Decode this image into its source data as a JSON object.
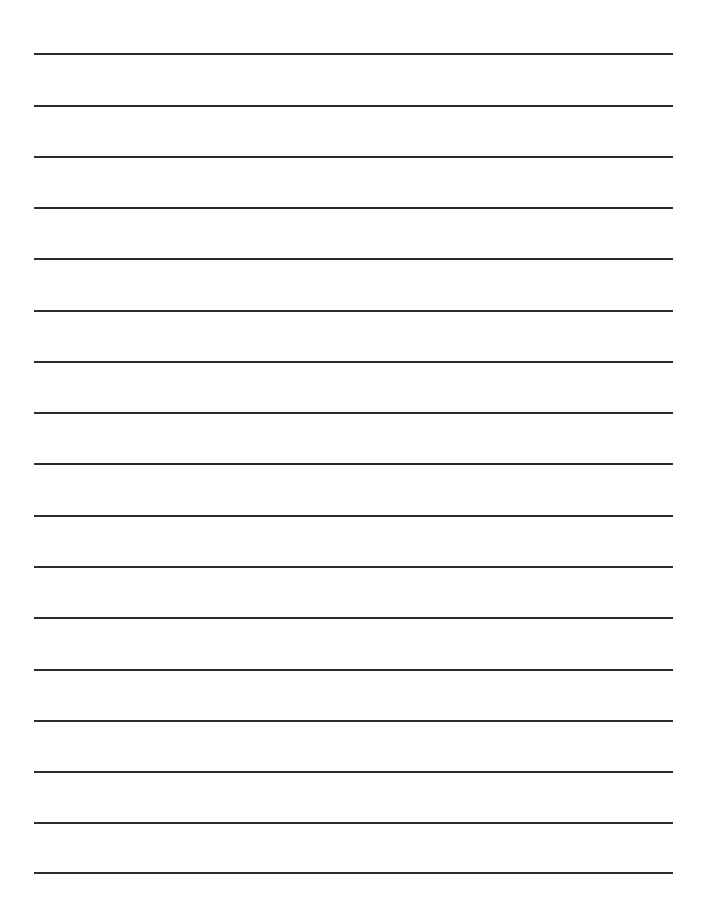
{
  "page": {
    "type": "lined-paper",
    "background": "#ffffff",
    "line_color": "#2b2b2b",
    "line_left": 34,
    "line_right": 673,
    "line_count": 17,
    "line_y": [
      54,
      106,
      157,
      208,
      259,
      311,
      362,
      413,
      464,
      516,
      567,
      618,
      670,
      721,
      772,
      823,
      873
    ]
  }
}
